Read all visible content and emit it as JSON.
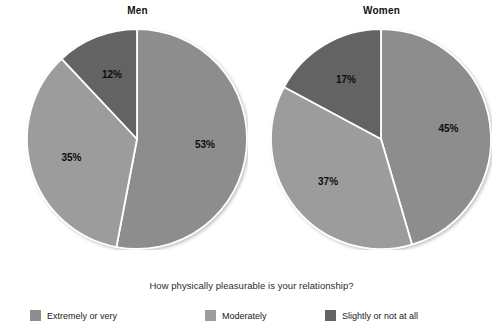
{
  "caption": "How physically pleasurable is your relationship?",
  "colors": {
    "extremely_or_very": "#8d8d8d",
    "moderately": "#9c9c9c",
    "slightly_or_not_at_all": "#636363",
    "divider": "#ffffff",
    "label_text": "#0c0c0c",
    "background": "#ffffff"
  },
  "legend": {
    "items": [
      {
        "label": "Extremely or very",
        "color": "#8d8d8d"
      },
      {
        "label": "Moderately",
        "color": "#9c9c9c"
      },
      {
        "label": "Slightly or not at all",
        "color": "#636363"
      }
    ]
  },
  "chart_data": [
    {
      "type": "pie",
      "title": "Men",
      "categories": [
        "Extremely or very",
        "Moderately",
        "Slightly or not at all"
      ],
      "values": [
        53,
        35,
        12
      ],
      "labels": [
        "53%",
        "35%",
        "12%"
      ],
      "colors": [
        "#8d8d8d",
        "#9c9c9c",
        "#636363"
      ],
      "start_angle_deg": 0,
      "direction": "clockwise",
      "units": "percent",
      "legend_position": "bottom"
    },
    {
      "type": "pie",
      "title": "Women",
      "categories": [
        "Extremely or very",
        "Moderately",
        "Slightly or not at all"
      ],
      "values": [
        45,
        37,
        17
      ],
      "labels": [
        "45%",
        "37%",
        "17%"
      ],
      "colors": [
        "#8d8d8d",
        "#9c9c9c",
        "#636363"
      ],
      "start_angle_deg": 0,
      "direction": "clockwise",
      "units": "percent",
      "legend_position": "bottom"
    }
  ]
}
